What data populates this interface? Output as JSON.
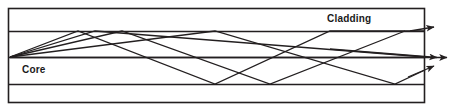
{
  "figure": {
    "width": 476,
    "height": 111,
    "background": "#ffffff",
    "stroke_color": "#231f20",
    "labels": {
      "cladding": "Cladding",
      "core": "Core"
    },
    "geometry": {
      "box": {
        "x1": 8,
        "y1": 8,
        "x2": 425,
        "y2": 103
      },
      "horizontal_lines_y": [
        8,
        31,
        57,
        84,
        103
      ],
      "core_top_y": 31,
      "core_bottom_y": 84,
      "axis_y": 57,
      "source_point": {
        "x": 10,
        "y": 57
      }
    },
    "rays": [
      {
        "name": "ray-axial",
        "points": "10,57 425,57 448,57",
        "arrow": {
          "x": 448,
          "y": 57
        }
      },
      {
        "name": "ray-low-angle",
        "points": "10,57 122,31 270,84 395,84 425,57 438,57",
        "arrow": {
          "x": 438,
          "y": 57
        }
      },
      {
        "name": "ray-mid-angle",
        "points": "10,57 78,31 215,84 330,31 425,31 432,29",
        "arrow": {
          "x": 432,
          "y": 29
        }
      },
      {
        "name": "ray-high-angle",
        "points": "10,57 215,31 395,84 425,70 432,68",
        "arrow": {
          "x": 432,
          "y": 68
        }
      }
    ],
    "arrow_count": 4
  }
}
